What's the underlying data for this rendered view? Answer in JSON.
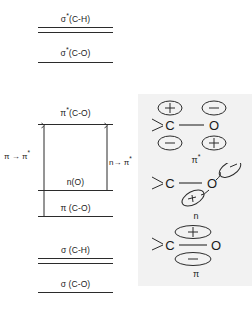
{
  "figure": {
    "background": "#ffffff",
    "line_color": "#2b2b2b",
    "panel_color": "#f2f2f2"
  },
  "energy_levels": [
    {
      "id": "sigma-star-ch",
      "label": "σ*(C-H)",
      "base": "σ",
      "star": true,
      "bond": "(C-H)",
      "y": 28,
      "style": "double",
      "antibonding": true
    },
    {
      "id": "sigma-star-co",
      "label": "σ*(C-O)",
      "base": "σ",
      "star": true,
      "bond": "(C-O)",
      "y": 62,
      "style": "single",
      "antibonding": true
    },
    {
      "id": "pi-star-co",
      "label": "π*(C-O)",
      "base": "π",
      "star": true,
      "bond": "(C-O)",
      "y": 124,
      "style": "single",
      "antibonding": true
    },
    {
      "id": "n-o",
      "label": "n(O)",
      "base": "n",
      "star": false,
      "bond": "(O)",
      "y": 190,
      "style": "single",
      "antibonding": false
    },
    {
      "id": "pi-co",
      "label": "π (C-O)",
      "base": "π",
      "star": false,
      "bond": "(C-O)",
      "y": 216,
      "style": "single",
      "antibonding": false
    },
    {
      "id": "sigma-ch",
      "label": "σ (C-H)",
      "base": "σ",
      "star": false,
      "bond": "(C-H)",
      "y": 258,
      "style": "double",
      "antibonding": false
    },
    {
      "id": "sigma-co",
      "label": "σ (C-O)",
      "base": "σ",
      "star": false,
      "bond": "(C-O)",
      "y": 292,
      "style": "single",
      "antibonding": false
    }
  ],
  "transitions": [
    {
      "id": "pi-to-pi-star",
      "label": "π → π*",
      "from": "pi-co",
      "to": "pi-star-co",
      "x": 44,
      "label_x": 5,
      "label_y": 152
    },
    {
      "id": "n-to-pi-star",
      "label": "n→ π*",
      "from": "n-o",
      "to": "pi-star-co",
      "x": 107,
      "label_x": 109,
      "label_y": 158
    }
  ],
  "orbital_pictures": [
    {
      "id": "pi-star-orbital",
      "caption": "π*",
      "atoms": [
        "C",
        "O"
      ],
      "lobes": [
        {
          "position": "above-C",
          "sign": "+"
        },
        {
          "position": "above-O",
          "sign": "−"
        },
        {
          "position": "below-C",
          "sign": "−"
        },
        {
          "position": "below-O",
          "sign": "+"
        }
      ]
    },
    {
      "id": "n-orbital",
      "caption": "n",
      "atoms": [
        "C",
        "O"
      ],
      "lobes": [
        {
          "position": "upper-right-of-O",
          "sign": "−"
        },
        {
          "position": "lower-left-of-O",
          "sign": "+"
        }
      ]
    },
    {
      "id": "pi-orbital",
      "caption": "π",
      "atoms": [
        "C",
        "O"
      ],
      "lobes": [
        {
          "position": "above-bond",
          "sign": "+"
        },
        {
          "position": "below-bond",
          "sign": "−"
        }
      ]
    }
  ]
}
